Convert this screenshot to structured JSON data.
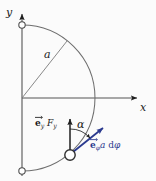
{
  "figure": {
    "background_color": "#fbfbfb",
    "stroke_color": "#4a4a4a",
    "axis_color": "#3c3c3c",
    "accent_color": "#2b3a8f",
    "node_fill": "#ffffff"
  },
  "axes": {
    "x_label": "x",
    "y_label": "y",
    "origin": {
      "x": 22,
      "y": 98
    }
  },
  "geometry": {
    "radius_px": 73,
    "radius_label": "a",
    "arc_start_deg": 90,
    "arc_end_deg": -90,
    "angle_label": "α",
    "radius_line_angle_deg": 52
  },
  "labels": {
    "force_vector": {
      "e_symbol": "e",
      "e_subscript": "y",
      "force_symbol": "F",
      "force_subscript": "y",
      "plain": "e_y F_y"
    },
    "arc_element_vector": {
      "e_symbol": "e",
      "e_subscript": "φ",
      "radius_symbol": "a",
      "differential": "d",
      "differential_var": "φ",
      "plain": "e_φ a dφ"
    }
  },
  "nodes": [
    {
      "name": "arc-top-node",
      "x": 22,
      "y": 25
    },
    {
      "name": "arc-bottom-node",
      "x": 22,
      "y": 171
    },
    {
      "name": "mass-point-node",
      "x": 70,
      "y": 155
    }
  ]
}
